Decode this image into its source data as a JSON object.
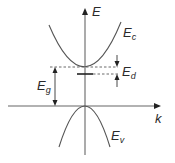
{
  "diagram": {
    "axes": {
      "y_label": "E",
      "x_label": "k"
    },
    "bands": {
      "conduction": {
        "label_main": "E",
        "label_sub": "c"
      },
      "valence": {
        "label_main": "E",
        "label_sub": "v"
      }
    },
    "annotations": {
      "band_gap": {
        "label_main": "E",
        "label_sub": "g"
      },
      "donor_ionization": {
        "label_main": "E",
        "label_sub": "d"
      }
    },
    "colors": {
      "curve": "#555555",
      "axis": "#666666",
      "text": "#2a2a2a"
    }
  }
}
